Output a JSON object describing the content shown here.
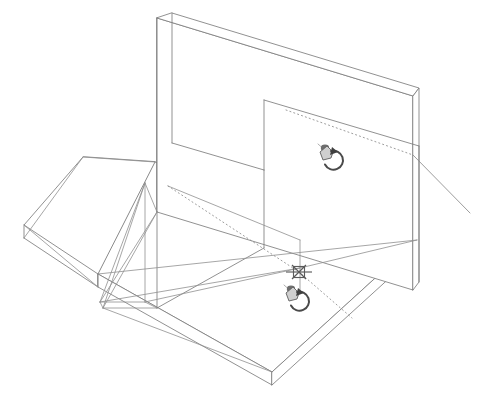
{
  "app": {
    "title": "Isometric CAD Wireframe Viewport",
    "viewport_label": "3D Model Space",
    "background_color": "#ffffff",
    "edge_color": "#7d7d7d",
    "hidden_edge_color": "#8a8a8a",
    "snap_marker_color": "#5b5b5b",
    "cursor_color": "#4a4a4a",
    "width": 482,
    "height": 396
  },
  "scene": {
    "projection": "isometric",
    "description": "Wireframe assembly of a horizontal base slab, an upright web plate and a triangular gusset stiffener",
    "parts": [
      {
        "id": "base-slab",
        "name": "Horizontal base slab",
        "type": "plate",
        "visible": true
      },
      {
        "id": "upright-plate",
        "name": "Vertical web plate",
        "type": "plate",
        "visible": true
      },
      {
        "id": "gusset",
        "name": "Triangular gusset stiffener",
        "type": "rib",
        "visible": true
      },
      {
        "id": "left-flange",
        "name": "Left cantilever flange",
        "type": "plate",
        "visible": true
      }
    ],
    "construction_lines": [
      {
        "id": "upper-trace",
        "name": "Upper projection trace",
        "style": "dotted"
      },
      {
        "id": "lower-trace",
        "name": "Lower projection trace",
        "style": "dotted"
      },
      {
        "id": "edge-extension",
        "name": "Edge extension line",
        "style": "solid"
      }
    ]
  },
  "markers": {
    "snap": {
      "name": "object-snap-intersection-marker",
      "glyph": "snap-intersection-icon",
      "x": 299,
      "y": 272,
      "label": "Intersection"
    },
    "cursors": [
      {
        "name": "orbit-cursor-upper",
        "glyph": "orbit-rotate-cursor-icon",
        "x": 330,
        "y": 155,
        "label": "3D Orbit"
      },
      {
        "name": "orbit-cursor-lower",
        "glyph": "orbit-rotate-cursor-icon",
        "x": 296,
        "y": 296,
        "label": "3D Orbit"
      }
    ]
  }
}
